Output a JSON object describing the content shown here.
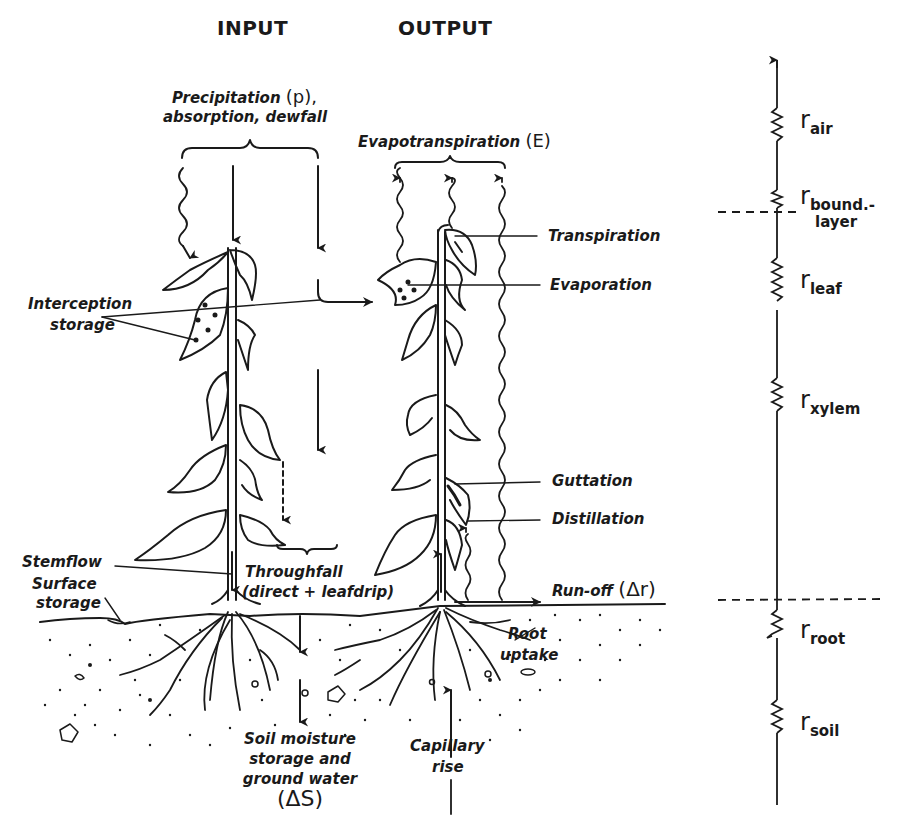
{
  "headers": {
    "input": "INPUT",
    "output": "OUTPUT"
  },
  "input_labels": {
    "precipitation_line1": "Precipitation",
    "precipitation_symbol": "(p),",
    "precipitation_line2": "absorption, dewfall",
    "interception_line1": "Interception",
    "interception_line2": "storage",
    "stemflow": "Stemflow",
    "surface_line1": "Surface",
    "surface_line2": "storage",
    "throughfall_line1": "Throughfall",
    "throughfall_line2": "(direct + leafdrip)",
    "soil_line1": "Soil moisture",
    "soil_line2": "storage  and",
    "soil_line3": "ground water",
    "soil_symbol": "(ΔS)"
  },
  "output_labels": {
    "evapotranspiration": "Evapotranspiration",
    "evapotranspiration_symbol": "(E)",
    "transpiration": "Transpiration",
    "evaporation": "Evaporation",
    "guttation": "Guttation",
    "distillation": "Distillation",
    "runoff": "Run-off",
    "runoff_symbol": "(Δr)",
    "root_line1": "Root",
    "root_line2": "uptake",
    "capillary_line1": "Capillary",
    "capillary_line2": "rise"
  },
  "resistances": [
    {
      "base": "r",
      "sub": "air"
    },
    {
      "base": "r",
      "sub": "bound.-",
      "sub2": "layer"
    },
    {
      "base": "r",
      "sub": "leaf"
    },
    {
      "base": "r",
      "sub": "xylem"
    },
    {
      "base": "r",
      "sub": "root"
    },
    {
      "base": "r",
      "sub": "soil"
    }
  ],
  "colors": {
    "ink": "#1a1a1a",
    "background": "#ffffff"
  }
}
